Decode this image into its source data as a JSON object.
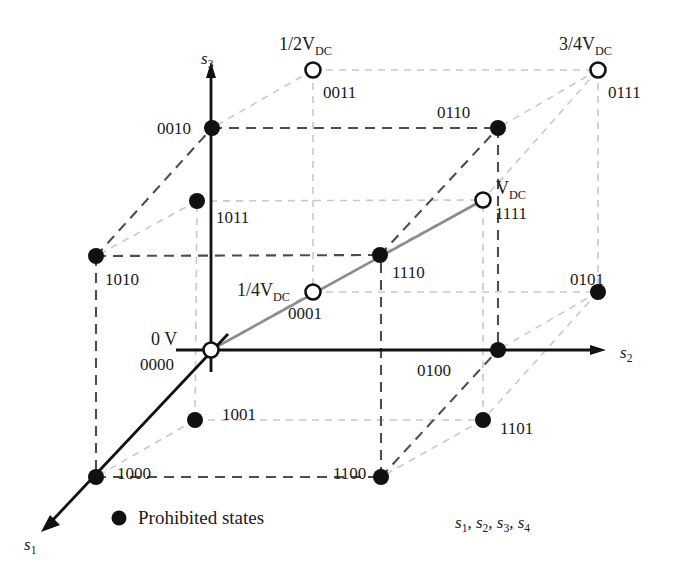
{
  "figure": {
    "type": "state-cube-diagram",
    "colors": {
      "solid_line": "#111111",
      "dashed_near": "#4d4d4d",
      "dashed_far": "#c9c9c9",
      "gray_path": "#8c8c8c",
      "node_fill": "#111111",
      "node_open_fill": "#ffffff",
      "text": "#1a1a1a"
    }
  },
  "axes": [
    {
      "id": "s1",
      "name": "s",
      "sub": "1",
      "x": 24,
      "y": 536,
      "arrow_from": [
        96,
        477
      ],
      "arrow_to": [
        44,
        529
      ]
    },
    {
      "id": "s2",
      "name": "s",
      "sub": "2",
      "x": 620,
      "y": 344,
      "arrow_from": [
        211,
        350
      ],
      "arrow_to": [
        604,
        350
      ]
    },
    {
      "id": "s3",
      "name": "s",
      "sub": "3",
      "x": 201,
      "y": 50,
      "arrow_from": [
        211,
        350
      ],
      "arrow_to": [
        211,
        66
      ]
    }
  ],
  "voltage_labels": [
    {
      "id": "v0",
      "text": "0 V",
      "x": 151,
      "y": 330,
      "frac": "",
      "vdc": false
    },
    {
      "id": "v025",
      "text": "1/4V",
      "x": 237,
      "y": 281,
      "frac": "1/4",
      "vdc": true
    },
    {
      "id": "v050",
      "text": "1/2V",
      "x": 279,
      "y": 35,
      "frac": "1/2",
      "vdc": true
    },
    {
      "id": "v075",
      "text": "3/4V",
      "x": 559,
      "y": 35,
      "frac": "3/4",
      "vdc": true
    },
    {
      "id": "v100",
      "text": "V",
      "x": 496,
      "y": 179,
      "frac": "",
      "vdc": true
    }
  ],
  "nodes": [
    {
      "code": "0000",
      "x": 211,
      "y": 350,
      "state": "open",
      "label_x": 140,
      "label_y": 356
    },
    {
      "code": "0001",
      "x": 313,
      "y": 292,
      "state": "open",
      "label_x": 288,
      "label_y": 305
    },
    {
      "code": "0011",
      "x": 313,
      "y": 70,
      "state": "open",
      "label_x": 323,
      "label_y": 84
    },
    {
      "code": "0111",
      "x": 598,
      "y": 70,
      "state": "open",
      "label_x": 608,
      "label_y": 84
    },
    {
      "code": "1111",
      "x": 483,
      "y": 200,
      "state": "open",
      "label_x": 495,
      "label_y": 205
    },
    {
      "code": "0010",
      "x": 212,
      "y": 128,
      "state": "filled",
      "label_x": 157,
      "label_y": 120
    },
    {
      "code": "0110",
      "x": 498,
      "y": 128,
      "state": "filled",
      "label_x": 437,
      "label_y": 104
    },
    {
      "code": "1011",
      "x": 197,
      "y": 201,
      "state": "filled",
      "label_x": 216,
      "label_y": 209
    },
    {
      "code": "1010",
      "x": 96,
      "y": 256,
      "state": "filled",
      "label_x": 105,
      "label_y": 271
    },
    {
      "code": "1110",
      "x": 380,
      "y": 255,
      "state": "filled",
      "label_x": 392,
      "label_y": 264
    },
    {
      "code": "0101",
      "x": 598,
      "y": 292,
      "state": "filled",
      "label_x": 570,
      "label_y": 271
    },
    {
      "code": "0100",
      "x": 498,
      "y": 350,
      "state": "filled",
      "label_x": 417,
      "label_y": 362
    },
    {
      "code": "1001",
      "x": 195,
      "y": 420,
      "state": "filled",
      "label_x": 222,
      "label_y": 406
    },
    {
      "code": "1101",
      "x": 483,
      "y": 420,
      "state": "filled",
      "label_x": 500,
      "label_y": 420
    },
    {
      "code": "1000",
      "x": 96,
      "y": 477,
      "state": "filled",
      "label_x": 117,
      "label_y": 465
    },
    {
      "code": "1100",
      "x": 381,
      "y": 477,
      "state": "filled",
      "label_x": 333,
      "label_y": 465
    }
  ],
  "legend": {
    "marker": "filled-circle",
    "label": "Prohibited states",
    "x": 138,
    "y": 518
  },
  "state_vector": {
    "text": "s1, s2, s3, s4",
    "parts": [
      "s",
      "1",
      "s",
      "2",
      "s",
      "3",
      "s",
      "4"
    ],
    "x": 455,
    "y": 514
  }
}
